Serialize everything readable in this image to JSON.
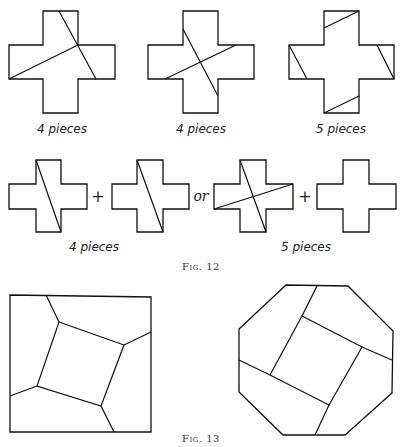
{
  "figure12": {
    "caption": "Fig. 12",
    "row1": [
      {
        "label": "4 pieces",
        "cuts": 2
      },
      {
        "label": "4 pieces",
        "cuts": 2
      },
      {
        "label": "5 pieces",
        "cuts": 4
      }
    ],
    "row2": {
      "left_group_label": "4 pieces",
      "right_group_label": "5 pieces",
      "plus_symbol": "+",
      "or_text": "or"
    }
  },
  "figure13": {
    "caption": "Fig. 13",
    "shapes": [
      "square dissection",
      "octagon dissection"
    ]
  }
}
